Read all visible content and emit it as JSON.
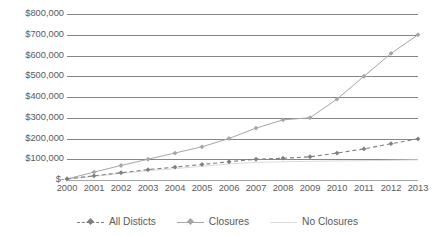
{
  "chart_data": {
    "type": "line",
    "title": "",
    "xlabel": "",
    "ylabel": "",
    "categories": [
      "2000",
      "2001",
      "2002",
      "2003",
      "2004",
      "2005",
      "2006",
      "2007",
      "2008",
      "2009",
      "2010",
      "2011",
      "2012",
      "2013"
    ],
    "ylim": [
      0,
      800000
    ],
    "ytick_values": [
      0,
      100000,
      200000,
      300000,
      400000,
      500000,
      600000,
      700000,
      800000
    ],
    "ytick_labels": [
      "$-",
      "$100,000",
      "$200,000",
      "$300,000",
      "$400,000",
      "$500,000",
      "$600,000",
      "$700,000",
      "$800,000"
    ],
    "grid": true,
    "legend_position": "bottom",
    "series": [
      {
        "name": "All Disticts",
        "style": "dashed",
        "color": "#7f7f7f",
        "marker": "diamond",
        "values": [
          5000,
          20000,
          35000,
          50000,
          62000,
          75000,
          88000,
          100000,
          105000,
          112000,
          130000,
          150000,
          175000,
          198000
        ]
      },
      {
        "name": "Closures",
        "style": "solid",
        "color": "#a6a6a6",
        "marker": "diamond",
        "values": [
          5000,
          38000,
          70000,
          100000,
          130000,
          160000,
          200000,
          250000,
          290000,
          300000,
          390000,
          500000,
          610000,
          700000
        ]
      },
      {
        "name": "No Closures",
        "style": "solid",
        "color": "#dcdcdc",
        "marker": "none",
        "values": [
          4000,
          18000,
          32000,
          45000,
          55000,
          66000,
          78000,
          85000,
          88000,
          90000,
          92000,
          93000,
          95000,
          97000
        ]
      }
    ]
  },
  "legend": {
    "items": [
      {
        "label": "All Disticts"
      },
      {
        "label": "Closures"
      },
      {
        "label": "No Closures"
      }
    ]
  },
  "colors": {
    "gridline": "#868686",
    "axis": "#a6a6a6",
    "text": "#5a5a5a",
    "background": "#ffffff"
  }
}
